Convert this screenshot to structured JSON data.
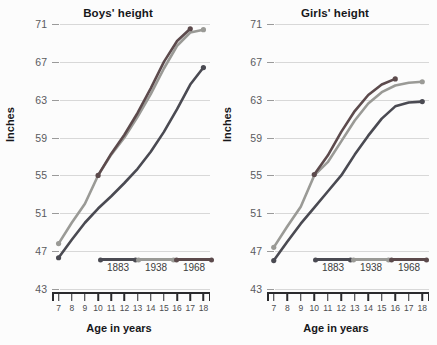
{
  "chart_data": [
    {
      "type": "line",
      "title": "Boys' height",
      "xlabel": "Age in years",
      "ylabel": "Inches",
      "xlim": [
        6.5,
        18.5
      ],
      "ylim": [
        43,
        71
      ],
      "x": [
        7,
        8,
        9,
        10,
        11,
        12,
        13,
        14,
        15,
        16,
        17,
        18
      ],
      "yticks": [
        71,
        67,
        63,
        59,
        55,
        51,
        47,
        43
      ],
      "xticks": [
        7,
        8,
        9,
        10,
        11,
        12,
        13,
        14,
        15,
        16,
        17,
        18
      ],
      "grid": true,
      "legend_position": "bottom-inside",
      "series": [
        {
          "name": "1883",
          "color": "#4a4a52",
          "values": [
            46.3,
            48.2,
            50.0,
            51.5,
            52.8,
            54.2,
            55.7,
            57.5,
            59.6,
            62.0,
            64.6,
            66.4
          ]
        },
        {
          "name": "1938",
          "color": "#9a9a96",
          "values": [
            47.8,
            50.0,
            52.0,
            55.0,
            57.2,
            59.0,
            61.2,
            63.6,
            66.3,
            68.7,
            70.1,
            70.4
          ]
        },
        {
          "name": "1968",
          "color": "#5c4a4c",
          "values": [
            null,
            null,
            null,
            55.0,
            57.3,
            59.3,
            61.6,
            64.2,
            67.0,
            69.2,
            70.5,
            null
          ]
        }
      ]
    },
    {
      "type": "line",
      "title": "Girls' height",
      "xlabel": "Age in years",
      "ylabel": "Inches",
      "xlim": [
        6.5,
        18.5
      ],
      "ylim": [
        43,
        71
      ],
      "x": [
        7,
        8,
        9,
        10,
        11,
        12,
        13,
        14,
        15,
        16,
        17,
        18
      ],
      "yticks": [
        71,
        67,
        63,
        59,
        55,
        51,
        47,
        43
      ],
      "xticks": [
        7,
        8,
        9,
        10,
        11,
        12,
        13,
        14,
        15,
        16,
        17,
        18
      ],
      "grid": true,
      "legend_position": "bottom-inside",
      "series": [
        {
          "name": "1883",
          "color": "#4a4a52",
          "values": [
            46.0,
            48.0,
            49.9,
            51.6,
            53.3,
            55.0,
            57.2,
            59.2,
            61.0,
            62.3,
            62.7,
            62.8
          ]
        },
        {
          "name": "1938",
          "color": "#9a9a96",
          "values": [
            47.4,
            49.6,
            51.7,
            55.0,
            56.4,
            58.6,
            60.8,
            62.6,
            63.8,
            64.5,
            64.8,
            64.9
          ]
        },
        {
          "name": "1968",
          "color": "#5c4a4c",
          "values": [
            null,
            null,
            null,
            55.1,
            57.1,
            59.6,
            61.8,
            63.5,
            64.6,
            65.2,
            null,
            null
          ]
        }
      ]
    }
  ],
  "panels": [
    {
      "id": "boys",
      "title": "Boys' height",
      "ylabel": "Inches",
      "xlabel": "Age in years",
      "yticks": [
        "71",
        "67",
        "63",
        "59",
        "55",
        "51",
        "47",
        "43"
      ],
      "xticks": [
        "7",
        "8",
        "9",
        "10",
        "11",
        "12",
        "13",
        "14",
        "15",
        "16",
        "17",
        "18"
      ],
      "legend": [
        {
          "label": "1883",
          "color": "#4a4a52"
        },
        {
          "label": "1938",
          "color": "#9a9a96"
        },
        {
          "label": "1968",
          "color": "#5c4a4c"
        }
      ]
    },
    {
      "id": "girls",
      "title": "Girls' height",
      "ylabel": "Inches",
      "xlabel": "Age in years",
      "yticks": [
        "71",
        "67",
        "63",
        "59",
        "55",
        "51",
        "47",
        "43"
      ],
      "xticks": [
        "7",
        "8",
        "9",
        "10",
        "11",
        "12",
        "13",
        "14",
        "15",
        "16",
        "17",
        "18"
      ],
      "legend": [
        {
          "label": "1883",
          "color": "#4a4a52"
        },
        {
          "label": "1938",
          "color": "#9a9a96"
        },
        {
          "label": "1968",
          "color": "#5c4a4c"
        }
      ]
    }
  ],
  "colors": {
    "background": "#fcfcfc",
    "gridline": "#d8d8d8",
    "axis": "#2a2a2d",
    "tick_text": "#5a5a5e",
    "title_text": "#17171a"
  }
}
